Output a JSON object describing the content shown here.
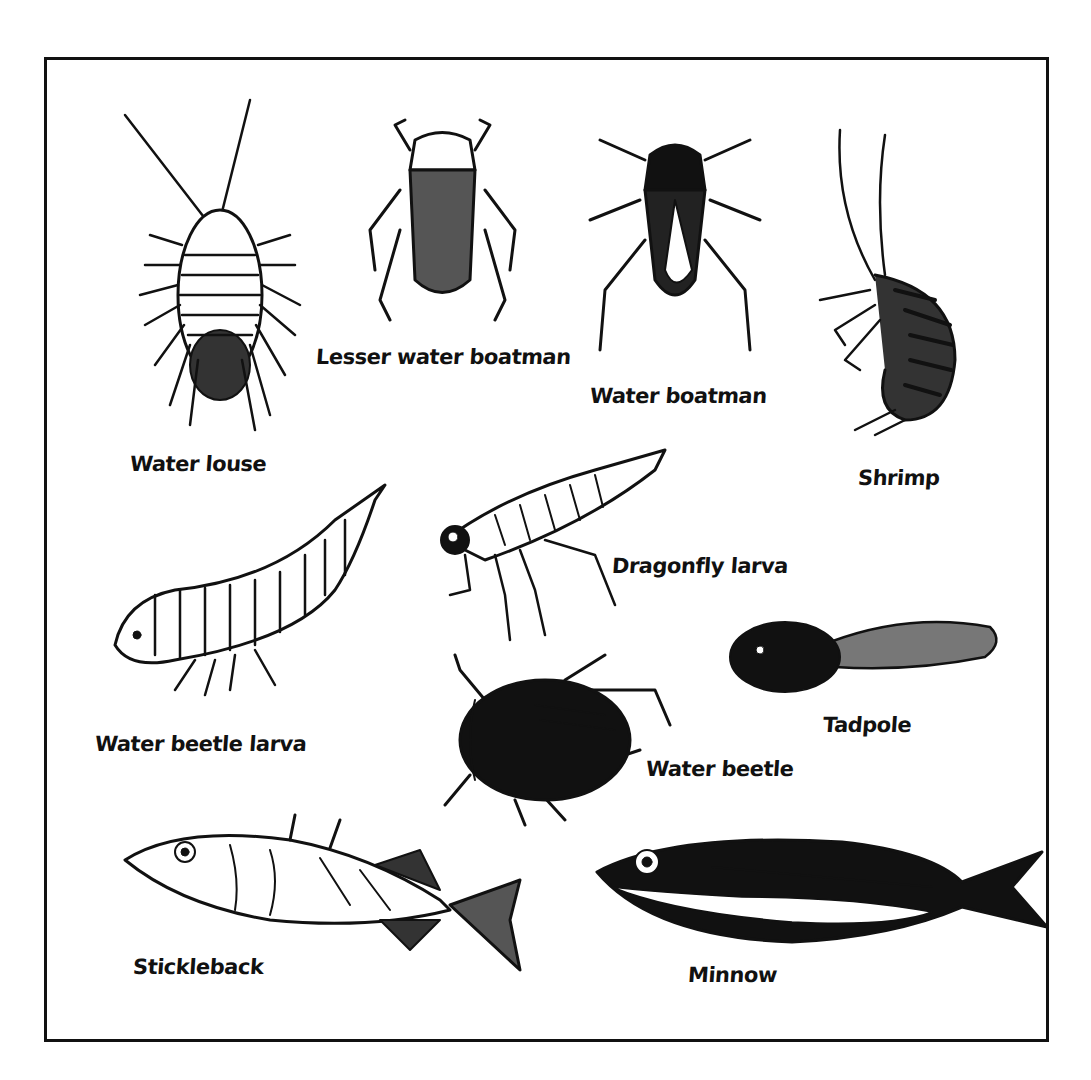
{
  "diagram": {
    "type": "illustrated-identification-chart",
    "creatures": [
      {
        "id": "water-louse",
        "label": "Water louse"
      },
      {
        "id": "lesser-water-boatman",
        "label": "Lesser water boatman"
      },
      {
        "id": "water-boatman",
        "label": "Water boatman"
      },
      {
        "id": "shrimp",
        "label": "Shrimp"
      },
      {
        "id": "dragonfly-larva",
        "label": "Dragonfly larva"
      },
      {
        "id": "water-beetle-larva",
        "label": "Water beetle larva"
      },
      {
        "id": "tadpole",
        "label": "Tadpole"
      },
      {
        "id": "water-beetle",
        "label": "Water beetle"
      },
      {
        "id": "stickleback",
        "label": "Stickleback"
      },
      {
        "id": "minnow",
        "label": "Minnow"
      }
    ],
    "colors": {
      "ink": "#111111",
      "paper": "#ffffff"
    }
  }
}
